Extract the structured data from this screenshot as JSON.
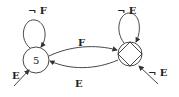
{
  "diagram": {
    "type": "state-machine",
    "states": [
      {
        "id": "s",
        "label": "5",
        "kind": "normal"
      },
      {
        "id": "t",
        "label": "",
        "kind": "accepting-diamond"
      }
    ],
    "transitions": [
      {
        "from": "s",
        "to": "s",
        "label": "¬ F"
      },
      {
        "from": "s",
        "to": "t",
        "label": "F"
      },
      {
        "from": "t",
        "to": "s",
        "label": "E"
      },
      {
        "from": "t",
        "to": "t",
        "label": "¬ E"
      },
      {
        "from": "entry",
        "to": "s",
        "label": "E"
      },
      {
        "from": "entry",
        "to": "t",
        "label": "¬ E"
      }
    ]
  }
}
